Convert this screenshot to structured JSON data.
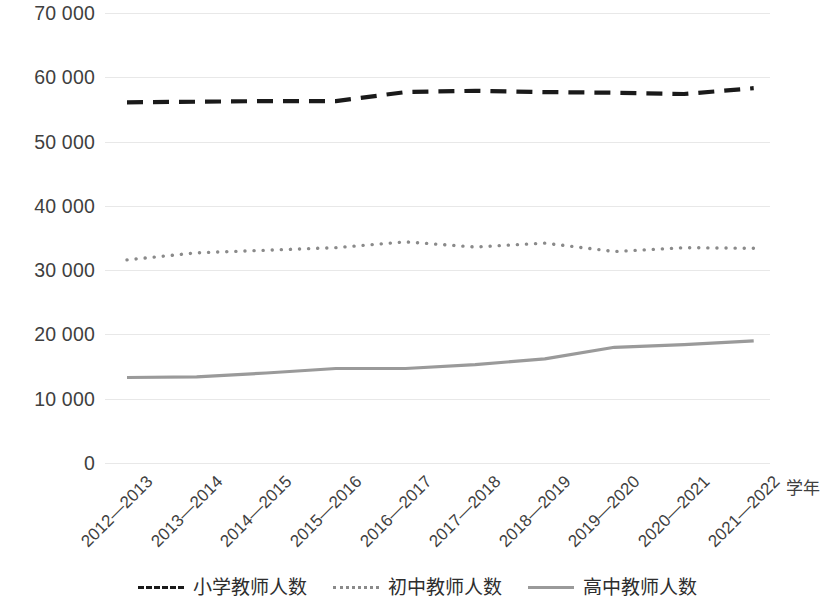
{
  "chart_data": {
    "type": "line",
    "title": "",
    "xlabel": "学年",
    "ylabel": "",
    "ylim": [
      0,
      70000
    ],
    "ytick_step": 10000,
    "grid": true,
    "legend_position": "bottom",
    "categories": [
      "2012—2013",
      "2013—2014",
      "2014—2015",
      "2015—2016",
      "2016—2017",
      "2017—2018",
      "2018—2019",
      "2019—2020",
      "2020—2021",
      "2021—2022"
    ],
    "ytick_labels": [
      "0",
      "10 000",
      "20 000",
      "30 000",
      "40 000",
      "50 000",
      "60 000",
      "70 000"
    ],
    "ytick_values": [
      0,
      10000,
      20000,
      30000,
      40000,
      50000,
      60000,
      70000
    ],
    "series": [
      {
        "name": "小学教师人数",
        "style": "dashed",
        "color": "#1a1a1a",
        "values": [
          56100,
          56200,
          56300,
          56300,
          57700,
          57900,
          57700,
          57600,
          57400,
          58300
        ]
      },
      {
        "name": "初中教师人数",
        "style": "dotted",
        "color": "#8a8a8a",
        "values": [
          31600,
          32700,
          33100,
          33500,
          34400,
          33600,
          34200,
          32900,
          33500,
          33400
        ]
      },
      {
        "name": "高中教师人数",
        "style": "solid",
        "color": "#9a9a9a",
        "values": [
          13300,
          13400,
          14000,
          14700,
          14700,
          15300,
          16200,
          18000,
          18400,
          19000
        ]
      }
    ]
  },
  "legend": {
    "items": [
      {
        "label": "小学教师人数",
        "swatch": "dashed-line-icon"
      },
      {
        "label": "初中教师人数",
        "swatch": "dotted-line-icon"
      },
      {
        "label": "高中教师人数",
        "swatch": "solid-line-icon"
      }
    ]
  },
  "axis": {
    "x_title": "学年"
  }
}
